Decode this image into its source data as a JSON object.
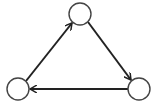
{
  "diagram": {
    "type": "directed-cycle-graph",
    "colors": {
      "stroke": "#222222",
      "node_fill": "#ffffff",
      "background": "#ffffff"
    },
    "nodes": [
      {
        "id": "top",
        "label": "",
        "cx": 80,
        "cy": 14,
        "r": 11
      },
      {
        "id": "bottom-right",
        "label": "",
        "cx": 139,
        "cy": 89,
        "r": 11
      },
      {
        "id": "bottom-left",
        "label": "",
        "cx": 18,
        "cy": 89,
        "r": 11
      }
    ],
    "edges": [
      {
        "from": "bottom-left",
        "to": "top"
      },
      {
        "from": "top",
        "to": "bottom-right"
      },
      {
        "from": "bottom-right",
        "to": "bottom-left"
      }
    ]
  }
}
